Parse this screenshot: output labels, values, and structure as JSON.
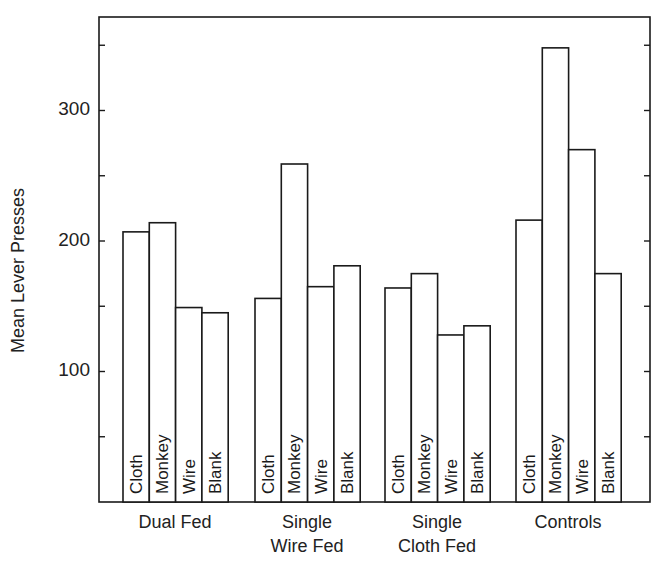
{
  "chart_data": {
    "type": "bar",
    "title": "",
    "xlabel": "",
    "ylabel": "Mean Lever Presses",
    "ylim": [
      0,
      370
    ],
    "yticks_labeled": [
      100,
      200,
      300
    ],
    "yticks_minor_step": 50,
    "grid": false,
    "legend": "none (bar labels written vertically inside bars)",
    "groups": [
      "Dual Fed",
      "Single\nWire Fed",
      "Single\nCloth Fed",
      "Controls"
    ],
    "bar_labels": [
      "Cloth",
      "Monkey",
      "Wire",
      "Blank"
    ],
    "series": [
      {
        "name": "Cloth",
        "values": [
          207,
          156,
          164,
          216
        ]
      },
      {
        "name": "Monkey",
        "values": [
          214,
          259,
          175,
          348
        ]
      },
      {
        "name": "Wire",
        "values": [
          149,
          165,
          128,
          270
        ]
      },
      {
        "name": "Blank",
        "values": [
          145,
          181,
          135,
          175
        ]
      }
    ]
  },
  "axis": {
    "ylabel": "Mean Lever Presses",
    "tick_labels": [
      "100",
      "200",
      "300"
    ]
  },
  "groups": [
    {
      "label": "Dual Fed"
    },
    {
      "label": "Single\nWire Fed"
    },
    {
      "label": "Single\nCloth Fed"
    },
    {
      "label": "Controls"
    }
  ],
  "colors": {
    "stroke": "#1a1a1a",
    "fill": "#ffffff"
  }
}
